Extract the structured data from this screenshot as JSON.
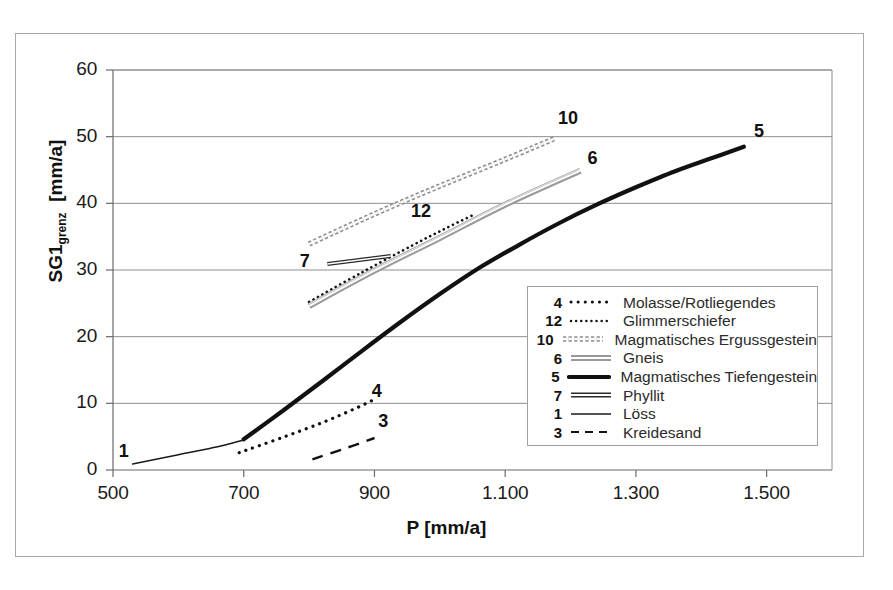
{
  "chart_data": {
    "type": "line",
    "title": "",
    "xlabel": "P [mm/a]",
    "ylabel": "SG1grenz [mm/a]",
    "ylabel_base": "SG1",
    "ylabel_sub": "grenz",
    "ylabel_unit": "[mm/a]",
    "xlim": [
      500,
      1600
    ],
    "ylim": [
      0,
      60
    ],
    "grid": true,
    "legend_position": "inside-lower-right",
    "xticks": [
      500,
      700,
      900,
      1100,
      1300,
      1500
    ],
    "xtick_labels": [
      "500",
      "700",
      "900",
      "1.100",
      "1.300",
      "1.500"
    ],
    "yticks": [
      0,
      10,
      20,
      30,
      40,
      50,
      60
    ],
    "ytick_labels": [
      "0",
      "10",
      "20",
      "30",
      "40",
      "50",
      "60"
    ],
    "series": [
      {
        "id": "4",
        "name": "Molasse/Rotliegendes",
        "style": "dotted-coarse",
        "color": "#111111",
        "width": 3.2,
        "label_x": 905,
        "label_y": 11.5,
        "points": [
          [
            693,
            2.6
          ],
          [
            760,
            4.9
          ],
          [
            820,
            7.1
          ],
          [
            870,
            9.2
          ],
          [
            900,
            10.6
          ]
        ]
      },
      {
        "id": "12",
        "name": "Glimmerschiefer",
        "style": "dotted-fine",
        "color": "#111111",
        "width": 2.6,
        "label_x": 965,
        "label_y": 38.5,
        "points": [
          [
            800,
            25.2
          ],
          [
            880,
            29.6
          ],
          [
            960,
            33.8
          ],
          [
            1010,
            36.3
          ],
          [
            1050,
            38.2
          ]
        ]
      },
      {
        "id": "10",
        "name": "Magmatisches Ergussgestein",
        "style": "bead-chain",
        "color": "#8c8c8c",
        "width": 5.5,
        "label_x": 1190,
        "label_y": 52.5,
        "points": [
          [
            800,
            33.9
          ],
          [
            900,
            38.4
          ],
          [
            1000,
            42.6
          ],
          [
            1100,
            46.6
          ],
          [
            1175,
            49.7
          ]
        ]
      },
      {
        "id": "6",
        "name": "Gneis",
        "style": "double-thin-grey",
        "color": "#9a9a9a",
        "width": 6,
        "label_x": 1235,
        "label_y": 46.5,
        "points": [
          [
            800,
            24.6
          ],
          [
            900,
            29.9
          ],
          [
            1000,
            34.8
          ],
          [
            1100,
            39.8
          ],
          [
            1215,
            44.9
          ]
        ]
      },
      {
        "id": "5",
        "name": "Magmatisches Tiefengestein",
        "style": "solid-thick",
        "color": "#111111",
        "width": 4.2,
        "label_x": 1490,
        "label_y": 50.5,
        "points": [
          [
            700,
            4.6
          ],
          [
            760,
            8.9
          ],
          [
            820,
            13.3
          ],
          [
            880,
            17.8
          ],
          [
            940,
            22.2
          ],
          [
            1000,
            26.4
          ],
          [
            1060,
            30.3
          ],
          [
            1120,
            33.7
          ],
          [
            1180,
            36.9
          ],
          [
            1240,
            39.8
          ],
          [
            1300,
            42.4
          ],
          [
            1360,
            44.8
          ],
          [
            1420,
            46.9
          ],
          [
            1465,
            48.5
          ]
        ]
      },
      {
        "id": "7",
        "name": "Phyllit",
        "style": "double-thick-dark",
        "color": "#2b2b2b",
        "width": 4,
        "label_x": 795,
        "label_y": 31.0,
        "points": [
          [
            828,
            30.9
          ],
          [
            925,
            32.1
          ]
        ]
      },
      {
        "id": "1",
        "name": "Löss",
        "style": "solid-thin",
        "color": "#1a1a1a",
        "width": 1.4,
        "label_x": 518,
        "label_y": 2.5,
        "points": [
          [
            530,
            0.9
          ],
          [
            600,
            2.3
          ],
          [
            660,
            3.5
          ],
          [
            700,
            4.5
          ]
        ]
      },
      {
        "id": "3",
        "name": "Kreidesand",
        "style": "dashed",
        "color": "#111111",
        "width": 2.4,
        "label_x": 915,
        "label_y": 7.0,
        "points": [
          [
            805,
            1.6
          ],
          [
            860,
            3.4
          ],
          [
            900,
            4.8
          ]
        ]
      }
    ]
  },
  "legend": {
    "entries": [
      {
        "num": "4",
        "label": "Molasse/Rotliegendes",
        "style": "dotted-coarse"
      },
      {
        "num": "12",
        "label": "Glimmerschiefer",
        "style": "dotted-fine"
      },
      {
        "num": "10",
        "label": "Magmatisches Ergussgestein",
        "style": "bead-chain"
      },
      {
        "num": "6",
        "label": "Gneis",
        "style": "double-thin-grey"
      },
      {
        "num": "5",
        "label": "Magmatisches Tiefengestein",
        "style": "solid-thick"
      },
      {
        "num": "7",
        "label": "Phyllit",
        "style": "double-thick-dark"
      },
      {
        "num": "1",
        "label": "Löss",
        "style": "solid-thin"
      },
      {
        "num": "3",
        "label": "Kreidesand",
        "style": "dashed"
      }
    ]
  },
  "caption_stub": "",
  "colors": {
    "frame": "#a9a9a9",
    "grid": "#8f8f8f",
    "axis": "#6a6a6a",
    "text": "#1a1a1a"
  }
}
